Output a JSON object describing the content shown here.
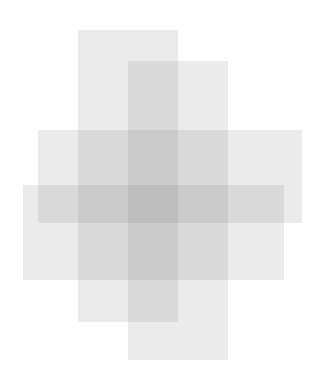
{
  "canvas": {
    "width": 315,
    "height": 383,
    "background": "#ffffff"
  },
  "shapes": [
    {
      "name": "tall-rect-left",
      "x": 78,
      "y": 30,
      "w": 100,
      "h": 292,
      "color": "rgba(120,120,120,0.15)"
    },
    {
      "name": "tall-rect-right",
      "x": 128,
      "y": 61,
      "w": 100,
      "h": 299,
      "color": "rgba(120,120,120,0.15)"
    },
    {
      "name": "wide-rect-upper",
      "x": 38,
      "y": 130,
      "w": 264,
      "h": 93,
      "color": "rgba(120,120,120,0.15)"
    },
    {
      "name": "wide-rect-lower",
      "x": 23,
      "y": 185,
      "w": 261,
      "h": 95,
      "color": "rgba(120,120,120,0.15)"
    }
  ]
}
